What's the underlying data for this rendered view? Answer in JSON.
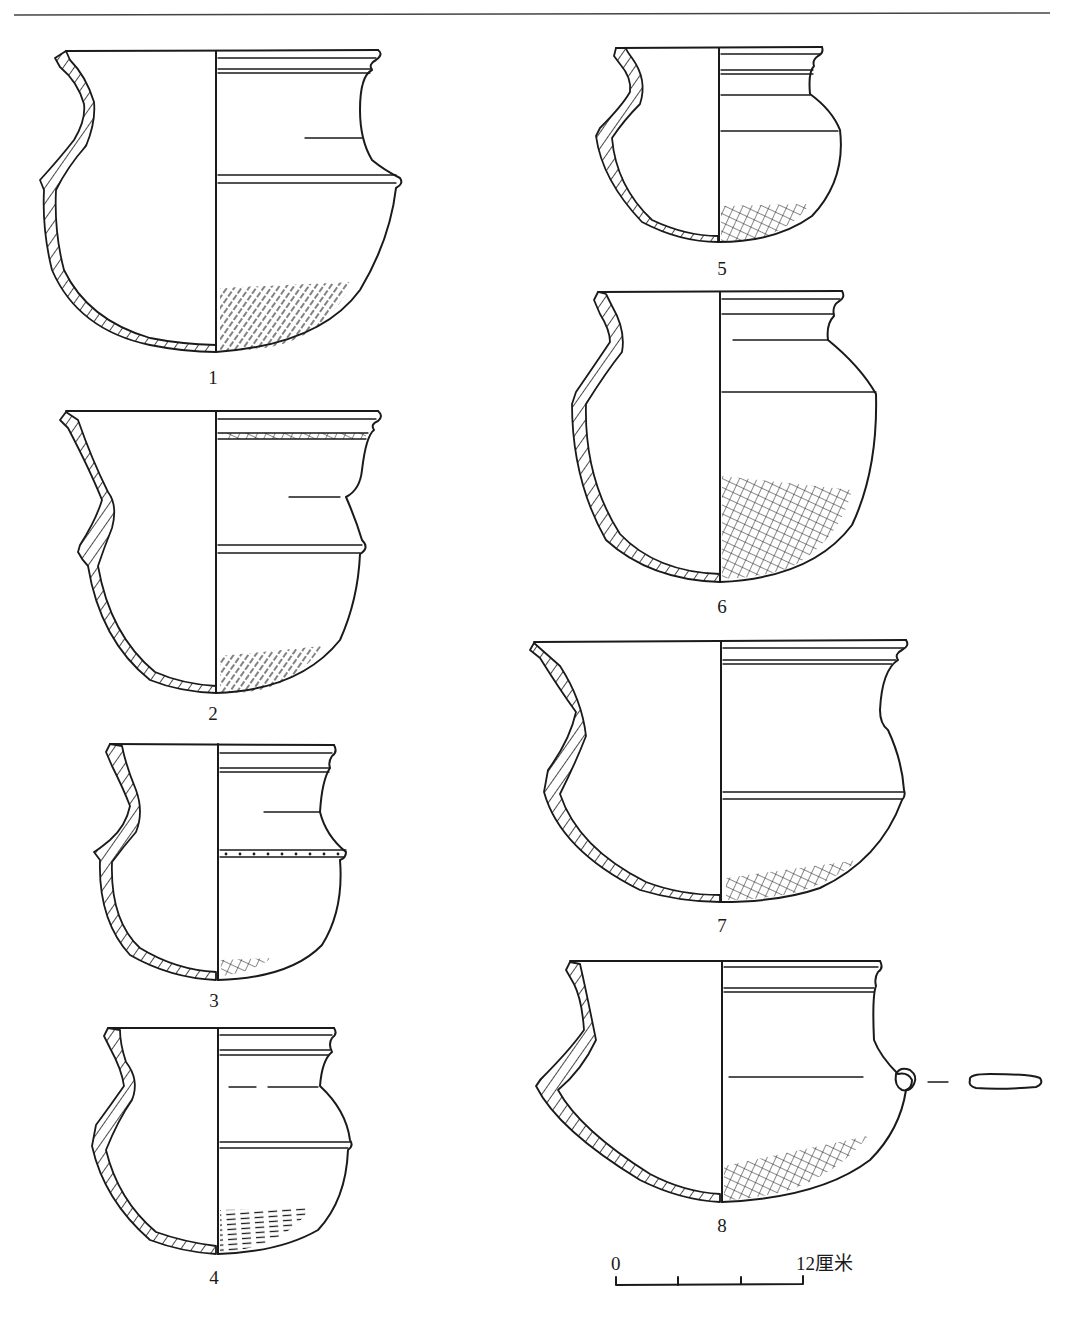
{
  "plate": {
    "background": "#ffffff",
    "ink_color": "#1a1a1a",
    "header_rule": true
  },
  "figures": [
    {
      "number": "1",
      "label": "1",
      "decoration": "cord-marked base",
      "features": [
        "rim grooves",
        "carinated shoulder ridge",
        "incised neck line"
      ]
    },
    {
      "number": "2",
      "label": "2",
      "decoration": "cord-marked base",
      "features": [
        "rim grooves",
        "notched band below rim",
        "shoulder ridge",
        "incised neck line"
      ]
    },
    {
      "number": "3",
      "label": "3",
      "decoration": "small crosshatched patch at base",
      "features": [
        "rim grooves",
        "notched shoulder ridge",
        "incised neck line"
      ]
    },
    {
      "number": "4",
      "label": "4",
      "decoration": "horizontal dash marks at base",
      "features": [
        "rim grooves",
        "shoulder ridge",
        "dashed neck line"
      ]
    },
    {
      "number": "5",
      "label": "5",
      "decoration": "crosshatched base",
      "features": [
        "rim grooves",
        "neck line",
        "shoulder line"
      ]
    },
    {
      "number": "6",
      "label": "6",
      "decoration": "crosshatched lower body",
      "features": [
        "rim grooves",
        "neck line",
        "shoulder line"
      ]
    },
    {
      "number": "7",
      "label": "7",
      "decoration": "crosshatched band at base",
      "features": [
        "rim grooves",
        "shoulder ridge"
      ]
    },
    {
      "number": "8",
      "label": "8",
      "decoration": "crosshatched base",
      "features": [
        "rim grooves",
        "incised belly line",
        "lug handle",
        "lug cross-section"
      ]
    }
  ],
  "scale_bar": {
    "start_label": "0",
    "end_label": "12厘米",
    "divisions": 3
  }
}
